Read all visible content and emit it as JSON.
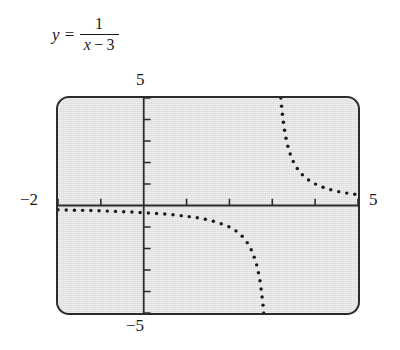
{
  "equation": {
    "lhs": "y",
    "equals": "=",
    "numerator": "1",
    "denominator_var": "x",
    "denominator_op": "−",
    "denominator_const": "3",
    "plain": "y = 1/(x - 3)"
  },
  "axis_labels": {
    "top": "5",
    "left": "−2",
    "right": "5",
    "bottom": "−5"
  },
  "colors": {
    "plot_background": "#e3e3e3",
    "frame": "#2b2b2b",
    "axis": "#2b2b2b",
    "curve": "#1a1a1a",
    "page_background": "#ffffff"
  },
  "chart_data": {
    "type": "line",
    "title": "",
    "xlabel": "",
    "ylabel": "",
    "xlim": [
      -2,
      5
    ],
    "ylim": [
      -5,
      5
    ],
    "grid": false,
    "legend": null,
    "style": "dotted",
    "asymptote_vertical_x": 3,
    "asymptote_horizontal_y": 0,
    "x_ticks": [
      -2,
      -1,
      0,
      1,
      2,
      3,
      4,
      5
    ],
    "y_ticks": [
      -5,
      -4,
      -3,
      -2,
      -1,
      0,
      1,
      2,
      3,
      4,
      5
    ],
    "function": "y = 1/(x - 3)",
    "series": [
      {
        "name": "left branch (x < 3)",
        "x": [
          -2,
          -1.75,
          -1.5,
          -1.25,
          -1,
          -0.75,
          -0.5,
          -0.25,
          0,
          0.25,
          0.5,
          0.75,
          1,
          1.25,
          1.5,
          1.75,
          2,
          2.15,
          2.3,
          2.45,
          2.55,
          2.65,
          2.72,
          2.78,
          2.83,
          2.87,
          2.9,
          2.93,
          2.95,
          2.965,
          2.98
        ],
        "y": [
          -0.2,
          -0.211,
          -0.222,
          -0.235,
          -0.25,
          -0.267,
          -0.286,
          -0.308,
          -0.333,
          -0.364,
          -0.4,
          -0.444,
          -0.5,
          -0.571,
          -0.667,
          -0.8,
          -1,
          -1.176,
          -1.429,
          -1.818,
          -2.222,
          -2.857,
          -3.571,
          -4.545,
          -5.882,
          -7.692,
          -10,
          -14.29,
          -20,
          -28.57,
          -50
        ]
      },
      {
        "name": "right branch (x > 3)",
        "x": [
          3.2,
          3.22,
          3.25,
          3.28,
          3.32,
          3.36,
          3.4,
          3.45,
          3.5,
          3.6,
          3.7,
          3.8,
          3.95,
          4.1,
          4.25,
          4.4,
          4.55,
          4.7,
          4.85,
          5
        ],
        "y": [
          5,
          4.545,
          4,
          3.571,
          3.125,
          2.778,
          2.5,
          2.222,
          2,
          1.667,
          1.429,
          1.25,
          1.053,
          0.909,
          0.8,
          0.714,
          0.645,
          0.588,
          0.541,
          0.5
        ]
      }
    ]
  }
}
